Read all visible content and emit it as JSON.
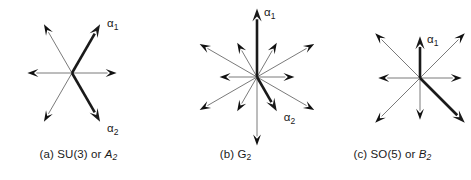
{
  "figure": {
    "background_color": "#ffffff",
    "ink_color": "#1a1a1a",
    "short_root_color": "#6b6b6b",
    "panel_count": 3
  },
  "panels": [
    {
      "id": "a",
      "caption_prefix": "(a)",
      "caption_group": "SU(3)",
      "caption_conjunction": "or",
      "caption_algebra_letter": "A",
      "caption_algebra_rank": "2",
      "caption_full": "(a) SU(3) or A2",
      "alpha1_label": "α",
      "alpha1_sub": "1",
      "alpha2_label": "α",
      "alpha2_sub": "2",
      "root_count": 6,
      "angle_step_deg": 60
    },
    {
      "id": "b",
      "caption_prefix": "(b)",
      "caption_group": "",
      "caption_conjunction": "",
      "caption_algebra_letter": "G",
      "caption_algebra_rank": "2",
      "caption_full": "(b) G2",
      "alpha1_label": "α",
      "alpha1_sub": "1",
      "alpha2_label": "α",
      "alpha2_sub": "2",
      "root_count": 12,
      "angle_step_deg": 30
    },
    {
      "id": "c",
      "caption_prefix": "(c)",
      "caption_group": "SO(5)",
      "caption_conjunction": "or",
      "caption_algebra_letter": "B",
      "caption_algebra_rank": "2",
      "caption_full": "(c) SO(5) or B2",
      "alpha1_label": "α",
      "alpha1_sub": "1",
      "alpha2_label": "α",
      "alpha2_sub": "2",
      "root_count": 8,
      "angle_step_deg": 45
    }
  ],
  "chart_data": {
    "type": "scatter",
    "subtitle": "",
    "xlabel": "",
    "ylabel": "",
    "grid": false,
    "legend": "none",
    "xlim": [
      -1.2,
      1.2
    ],
    "ylim": [
      -1.2,
      1.2
    ],
    "series": [
      {
        "name": "(a) SU(3) or A2",
        "panel": "a",
        "center_px": [
          72,
          73
        ],
        "roots": [
          {
            "angle_deg": 0,
            "length": 0.62,
            "emphasis": "thin",
            "label": ""
          },
          {
            "angle_deg": 60,
            "length": 0.78,
            "emphasis": "bold",
            "label": "α1"
          },
          {
            "angle_deg": 120,
            "length": 0.78,
            "emphasis": "thin",
            "label": ""
          },
          {
            "angle_deg": 180,
            "length": 0.62,
            "emphasis": "thin",
            "label": ""
          },
          {
            "angle_deg": 240,
            "length": 0.78,
            "emphasis": "thin",
            "label": ""
          },
          {
            "angle_deg": 300,
            "length": 0.78,
            "emphasis": "bold",
            "label": "α2"
          }
        ]
      },
      {
        "name": "(b) G2",
        "panel": "b",
        "center_px": [
          257,
          77
        ],
        "roots": [
          {
            "angle_deg": 0,
            "length": 0.52,
            "emphasis": "thin",
            "label": ""
          },
          {
            "angle_deg": 30,
            "length": 0.92,
            "emphasis": "thin",
            "label": ""
          },
          {
            "angle_deg": 60,
            "length": 0.55,
            "emphasis": "thin",
            "label": ""
          },
          {
            "angle_deg": 90,
            "length": 0.95,
            "emphasis": "bold",
            "label": "α1"
          },
          {
            "angle_deg": 120,
            "length": 0.55,
            "emphasis": "thin",
            "label": ""
          },
          {
            "angle_deg": 150,
            "length": 0.92,
            "emphasis": "thin",
            "label": ""
          },
          {
            "angle_deg": 180,
            "length": 0.52,
            "emphasis": "thin",
            "label": ""
          },
          {
            "angle_deg": 210,
            "length": 0.92,
            "emphasis": "thin",
            "label": ""
          },
          {
            "angle_deg": 240,
            "length": 0.55,
            "emphasis": "thin",
            "label": ""
          },
          {
            "angle_deg": 270,
            "length": 0.95,
            "emphasis": "thin",
            "label": ""
          },
          {
            "angle_deg": 300,
            "length": 0.55,
            "emphasis": "bold",
            "label": "α2"
          },
          {
            "angle_deg": 330,
            "length": 0.92,
            "emphasis": "thin",
            "label": ""
          }
        ]
      },
      {
        "name": "(c) SO(5) or B2",
        "panel": "c",
        "center_px": [
          420,
          78
        ],
        "roots": [
          {
            "angle_deg": 0,
            "length": 0.58,
            "emphasis": "thin",
            "label": ""
          },
          {
            "angle_deg": 45,
            "length": 0.88,
            "emphasis": "thin",
            "label": ""
          },
          {
            "angle_deg": 90,
            "length": 0.58,
            "emphasis": "bold",
            "label": "α1"
          },
          {
            "angle_deg": 135,
            "length": 0.88,
            "emphasis": "thin",
            "label": ""
          },
          {
            "angle_deg": 180,
            "length": 0.58,
            "emphasis": "thin",
            "label": ""
          },
          {
            "angle_deg": 225,
            "length": 0.88,
            "emphasis": "thin",
            "label": ""
          },
          {
            "angle_deg": 270,
            "length": 0.58,
            "emphasis": "thin",
            "label": ""
          },
          {
            "angle_deg": 315,
            "length": 0.88,
            "emphasis": "bold",
            "label": "α2"
          }
        ]
      }
    ]
  }
}
